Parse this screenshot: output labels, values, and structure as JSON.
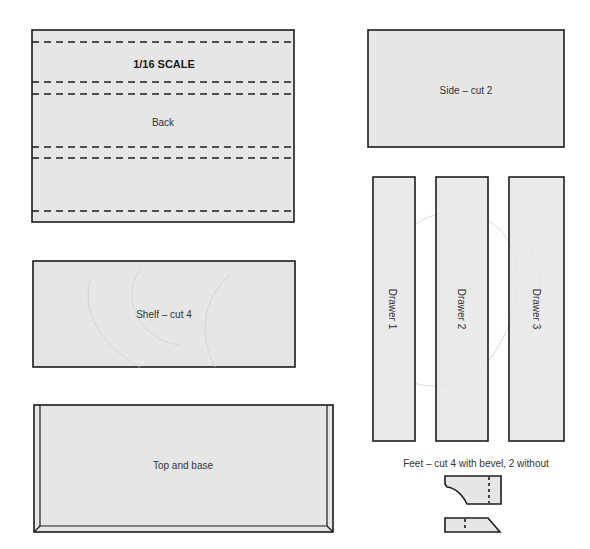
{
  "title": "1/16 SCALE",
  "pieces": {
    "back": {
      "label": "Back"
    },
    "side": {
      "label": "Side – cut 2"
    },
    "shelf": {
      "label": "Shelf – cut 4"
    },
    "top_base": {
      "label": "Top and base"
    },
    "drawers": [
      {
        "label": "Drawer 1"
      },
      {
        "label": "Drawer 2"
      },
      {
        "label": "Drawer 3"
      }
    ],
    "feet": {
      "label": "Feet – cut 4 with bevel, 2 without"
    }
  },
  "colors": {
    "panel_fill": "#e6e6e6",
    "outline": "#1c1c1c",
    "text": "#333333"
  }
}
